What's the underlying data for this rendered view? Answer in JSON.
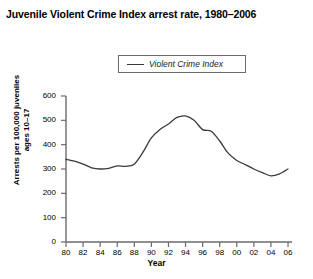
{
  "chart_data": {
    "type": "line",
    "title": "Juvenile Violent Crime Index arrest rate, 1980–2006",
    "xlabel": "Year",
    "ylabel": "Arrests per 100,000 juveniles ages 10–17",
    "ylim": [
      0,
      600
    ],
    "xlim": [
      1980,
      2006
    ],
    "ytick_labels": [
      "600",
      "500",
      "400",
      "300",
      "200",
      "100",
      "0"
    ],
    "ytick_values": [
      600,
      500,
      400,
      300,
      200,
      100,
      0
    ],
    "xtick_labels": [
      "80",
      "82",
      "84",
      "86",
      "88",
      "90",
      "92",
      "94",
      "96",
      "98",
      "00",
      "02",
      "04",
      "06"
    ],
    "xtick_values": [
      1980,
      1982,
      1984,
      1986,
      1988,
      1990,
      1992,
      1994,
      1996,
      1998,
      2000,
      2002,
      2004,
      2006
    ],
    "grid": false,
    "legend_position": "top-center",
    "series": [
      {
        "name": "Violent Crime Index",
        "color": "#3a3a3a",
        "x": [
          1980,
          1981,
          1982,
          1983,
          1984,
          1985,
          1986,
          1987,
          1988,
          1989,
          1990,
          1991,
          1992,
          1993,
          1994,
          1995,
          1996,
          1997,
          1998,
          1999,
          2000,
          2001,
          2002,
          2003,
          2004,
          2005,
          2006
        ],
        "values": [
          340,
          332,
          320,
          305,
          300,
          303,
          313,
          311,
          320,
          368,
          428,
          462,
          485,
          512,
          518,
          500,
          462,
          455,
          415,
          365,
          335,
          318,
          300,
          285,
          272,
          280,
          300
        ]
      }
    ]
  },
  "legend": {
    "entries": [
      {
        "label": "Violent Crime Index"
      }
    ]
  }
}
